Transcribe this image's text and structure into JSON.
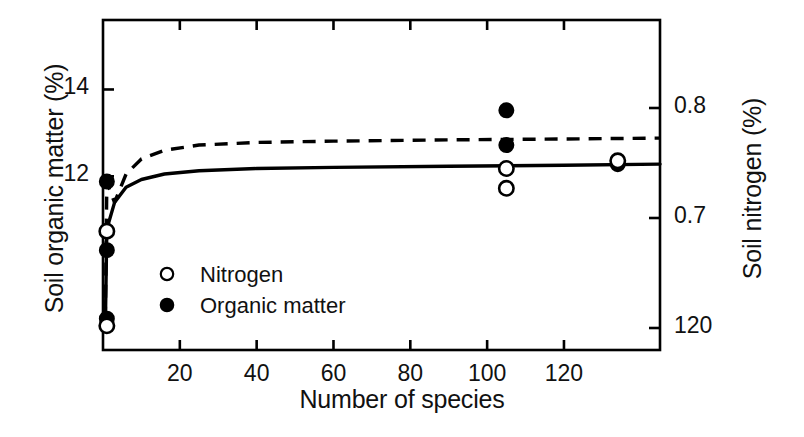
{
  "chart_data": {
    "type": "scatter",
    "title": "",
    "xlabel": "Number of species",
    "ylabel": "Soil organic matter (%)",
    "ylabel_right": "Soil nitrogen (%)",
    "xlim": [
      0,
      145
    ],
    "xticks": [
      20,
      40,
      60,
      80,
      100,
      120
    ],
    "xticklabels": [
      "20",
      "40",
      "60",
      "80",
      "100",
      "120"
    ],
    "ylim_left": [
      8.0,
      15.6
    ],
    "yticks_left": [
      14,
      12
    ],
    "yticklabels_left": [
      "14",
      "12"
    ],
    "ylim_right": [
      0.58,
      0.88
    ],
    "yticks_right": [
      0.8,
      0.7,
      0.6
    ],
    "yticklabels_right": [
      "0.8",
      "0.7",
      "120"
    ],
    "grid": false,
    "box": true,
    "legend_position": "inside-left",
    "series": [
      {
        "name": "Nitrogen",
        "marker": "open-circle",
        "line": "solid",
        "axis": "right",
        "points": [
          {
            "x": 1,
            "y": 0.602
          },
          {
            "x": 1,
            "y": 0.688
          },
          {
            "x": 105,
            "y": 0.745
          },
          {
            "x": 105,
            "y": 0.727
          },
          {
            "x": 134,
            "y": 0.752
          }
        ],
        "curve": [
          {
            "x": 0.6,
            "y": 0.6
          },
          {
            "x": 1,
            "y": 0.69
          },
          {
            "x": 3,
            "y": 0.714
          },
          {
            "x": 6,
            "y": 0.728
          },
          {
            "x": 10,
            "y": 0.735
          },
          {
            "x": 16,
            "y": 0.74
          },
          {
            "x": 25,
            "y": 0.743
          },
          {
            "x": 40,
            "y": 0.745
          },
          {
            "x": 60,
            "y": 0.746
          },
          {
            "x": 90,
            "y": 0.747
          },
          {
            "x": 120,
            "y": 0.748
          },
          {
            "x": 145,
            "y": 0.749
          }
        ]
      },
      {
        "name": "Organic matter",
        "marker": "filled-circle",
        "line": "dashed",
        "axis": "left",
        "points": [
          {
            "x": 1,
            "y": 8.72
          },
          {
            "x": 1,
            "y": 10.3
          },
          {
            "x": 1,
            "y": 11.88
          },
          {
            "x": 105,
            "y": 13.52
          },
          {
            "x": 105,
            "y": 12.72
          },
          {
            "x": 134,
            "y": 12.28
          }
        ],
        "curve": [
          {
            "x": 0.6,
            "y": 8.7
          },
          {
            "x": 1,
            "y": 11.86
          },
          {
            "x": 3,
            "y": 11.4
          },
          {
            "x": 6,
            "y": 12.05
          },
          {
            "x": 10,
            "y": 12.4
          },
          {
            "x": 16,
            "y": 12.6
          },
          {
            "x": 25,
            "y": 12.72
          },
          {
            "x": 40,
            "y": 12.78
          },
          {
            "x": 60,
            "y": 12.81
          },
          {
            "x": 90,
            "y": 12.84
          },
          {
            "x": 120,
            "y": 12.86
          },
          {
            "x": 145,
            "y": 12.88
          }
        ]
      }
    ],
    "legend": [
      {
        "label": "Nitrogen",
        "marker": "open-circle"
      },
      {
        "label": "Organic matter",
        "marker": "filled-circle"
      }
    ],
    "colors": {
      "axis": "#000000",
      "nitrogen": "#000000",
      "organic_matter": "#000000",
      "background": "#ffffff"
    }
  }
}
